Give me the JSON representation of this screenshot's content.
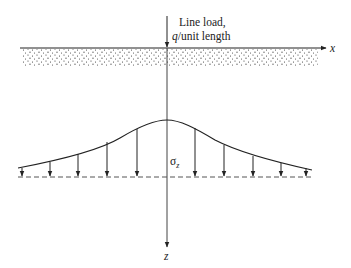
{
  "diagram": {
    "load_label_line1": "Line load,",
    "load_label_q": "q",
    "load_label_line2_rest": "/unit length",
    "x_axis_label": "x",
    "z_axis_label": "z",
    "stress_label_symbol": "σ",
    "stress_label_subscript": "z",
    "stress_arrow_x_positions": [
      22,
      50,
      78,
      107,
      137,
      195,
      224,
      253,
      281,
      306
    ],
    "colors": {
      "line": "#222222",
      "soil_dots": "#333333",
      "dashed_baseline": "#555555"
    }
  }
}
